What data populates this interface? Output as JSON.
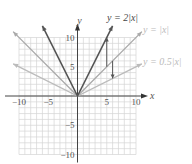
{
  "chart_data": {
    "type": "line",
    "title": "",
    "xlabel": "x",
    "ylabel": "y",
    "xlim": [
      -10,
      10
    ],
    "ylim": [
      -10,
      10
    ],
    "grid": true,
    "x_ticks": [
      -10,
      -5,
      5,
      10
    ],
    "y_ticks": [
      10,
      5,
      -5,
      -10
    ],
    "x_tick_labels": [
      "−10",
      "−5",
      "5",
      "10"
    ],
    "y_tick_labels": [
      "10",
      "5",
      "−5",
      "−10"
    ],
    "series": [
      {
        "name": "y = 2|x|",
        "label": "y = 2|x|",
        "color": "#555555",
        "x": [
          -6,
          0,
          6
        ],
        "values": [
          12,
          0,
          12
        ]
      },
      {
        "name": "y = |x|",
        "label": "y = |x|",
        "color": "#aaaaaa",
        "x": [
          -11,
          0,
          11
        ],
        "values": [
          11,
          0,
          11
        ]
      },
      {
        "name": "y = 0.5|x|",
        "label": "y = 0.5|x|",
        "color": "#bbbbbb",
        "x": [
          -11,
          0,
          11
        ],
        "values": [
          5.5,
          0,
          5.5
        ]
      }
    ],
    "annotations": [
      {
        "type": "arrow",
        "from": [
          5,
          5
        ],
        "to": [
          5,
          10
        ],
        "description": "stretch from |x| to 2|x|"
      },
      {
        "type": "arrow",
        "from": [
          6,
          6
        ],
        "to": [
          6,
          3
        ],
        "description": "compression from |x| to 0.5|x|"
      }
    ]
  }
}
